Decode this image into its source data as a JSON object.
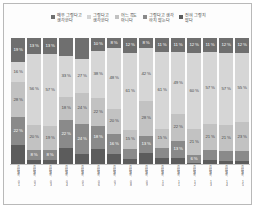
{
  "chart_data": {
    "type": "bar",
    "subtype": "100% stacked horizontal-category column chart",
    "title": "",
    "subtitle": "",
    "xlabel": "",
    "ylabel": "",
    "ylim": [
      0,
      100
    ],
    "grid": false,
    "legend_position": "top-center",
    "value_suffix": "%",
    "stack_total": 100,
    "categories": [
      "항목1",
      "항목2",
      "항목3",
      "항목4",
      "항목5",
      "항목6",
      "항목7",
      "항목8",
      "항목9",
      "항목10",
      "항목11",
      "항목12",
      "항목13",
      "항목14",
      "항목15"
    ],
    "series": [
      {
        "name": "매우 그렇다고 생각한다",
        "color": "#6f6f6f",
        "label_color": "#ffffff",
        "values": [
          19,
          13,
          13,
          14,
          17,
          10,
          8,
          12,
          8,
          11,
          11,
          12,
          11,
          12,
          12
        ]
      },
      {
        "name": "그렇다고 생각한다",
        "color": "#d6d6d6",
        "label_color": "#4a4a4a",
        "values": [
          16,
          56,
          57,
          33,
          27,
          38,
          48,
          61,
          42,
          61,
          49,
          60,
          57,
          57,
          55
        ]
      },
      {
        "name": "어느 쪽도 아니다",
        "color": "#c2c2c2",
        "label_color": "#4a4a4a",
        "values": [
          28,
          20,
          19,
          18,
          24,
          22,
          20,
          15,
          28,
          15,
          22,
          21,
          21,
          21,
          23
        ]
      },
      {
        "name": "그렇다고 생각하지 않는다",
        "color": "#8a8a8a",
        "label_color": "#ffffff",
        "values": [
          22,
          8,
          8,
          22,
          24,
          18,
          16,
          8,
          13,
          8,
          13,
          6,
          8,
          8,
          8
        ]
      },
      {
        "name": "전혀 그렇지 않다",
        "color": "#5c5c5c",
        "label_color": "#ffffff",
        "values": [
          15,
          3,
          3,
          13,
          8,
          12,
          8,
          4,
          9,
          5,
          5,
          1,
          3,
          2,
          2
        ]
      }
    ],
    "visible_labels": {
      "series_0": [
        "19 %",
        "13 %",
        "13 %",
        "",
        "",
        "10 %",
        "8 %",
        "12 %",
        "8 %",
        "11 %",
        "11 %",
        "12 %",
        "11 %",
        "12 %",
        "12 %"
      ],
      "series_1": [
        "16 %",
        "56 %",
        "57 %",
        "33 %",
        "27 %",
        "38 %",
        "48 %",
        "61 %",
        "42 %",
        "61 %",
        "49 %",
        "60 %",
        "57 %",
        "57 %",
        "55 %"
      ],
      "series_2": [
        "28 %",
        "20 %",
        "19 %",
        "18 %",
        "24 %",
        "22 %",
        "20 %",
        "15 %",
        "28 %",
        "15 %",
        "22 %",
        "21 %",
        "21 %",
        "21 %",
        "23 %"
      ],
      "series_3": [
        "22 %",
        "8 %",
        "8 %",
        "22 %",
        "24 %",
        "18 %",
        "16 %",
        "",
        "13 %",
        "",
        "13 %",
        "6 %",
        "",
        "",
        ""
      ],
      "series_4": [
        "",
        "",
        "",
        "",
        "",
        "",
        "",
        "",
        "",
        "",
        "",
        "",
        "",
        "",
        ""
      ]
    }
  },
  "legend": {
    "items": [
      {
        "label": "매우 그렇다고\n생각한다",
        "color": "#6f6f6f"
      },
      {
        "label": "그렇다고\n생각한다",
        "color": "#d6d6d6"
      },
      {
        "label": "어느 쪽도\n아니다",
        "color": "#c2c2c2"
      },
      {
        "label": "그렇다고 생각\n하지 않는다",
        "color": "#8a8a8a"
      },
      {
        "label": "전혀 그렇지\n않다",
        "color": "#5c5c5c"
      }
    ]
  },
  "axis_labels": [
    "응답항목 01",
    "응답항목 02",
    "응답항목 03",
    "응답항목 04",
    "응답항목 05",
    "응답항목 06",
    "응답항목 07",
    "응답항목 08",
    "응답항목 09",
    "응답항목 10",
    "응답항목 11",
    "응답항목 12",
    "응답항목 13",
    "응답항목 14",
    "응답항목 15"
  ],
  "style": {
    "background": "#fdfdfd",
    "border": "#b9b9b9",
    "axis_line": "#c4c4c4"
  }
}
